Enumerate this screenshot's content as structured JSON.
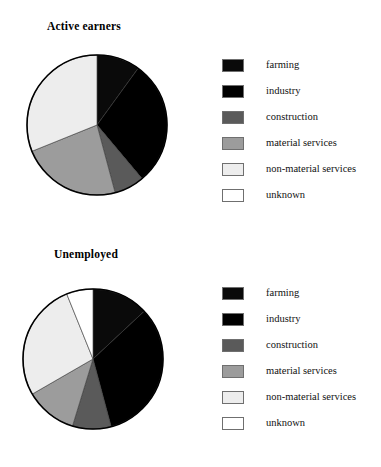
{
  "figure": {
    "background": "#ffffff",
    "palette": {
      "farming": "#0a0a0a",
      "industry": "#000000",
      "construction": "#5a5a5a",
      "material_services": "#9c9c9c",
      "non_material_services": "#ededed",
      "unknown": "#ffffff",
      "outline": "#000000",
      "swatch_border": "#6f6f6f"
    }
  },
  "charts": [
    {
      "id": "active-earners",
      "title": "Active earners",
      "geometry": {
        "cx": 96,
        "cy": 124,
        "r": 70,
        "start_angle_deg": 0
      },
      "legend": [
        {
          "key": "farming",
          "label": "farming",
          "color": "#0a0a0a"
        },
        {
          "key": "industry",
          "label": "industry",
          "color": "#000000"
        },
        {
          "key": "construction",
          "label": "construction",
          "color": "#5a5a5a"
        },
        {
          "key": "material-services",
          "label": "material services",
          "color": "#9c9c9c"
        },
        {
          "key": "non-material-services",
          "label": "non-material services",
          "color": "#ededed"
        },
        {
          "key": "unknown",
          "label": "unknown",
          "color": "#ffffff"
        }
      ]
    },
    {
      "id": "unemployed",
      "title": "Unemployed",
      "geometry": {
        "cx": 92,
        "cy": 125,
        "r": 70,
        "start_angle_deg": 0
      },
      "legend": [
        {
          "key": "farming",
          "label": "farming",
          "color": "#0a0a0a"
        },
        {
          "key": "industry",
          "label": "industry",
          "color": "#000000"
        },
        {
          "key": "construction",
          "label": "construction",
          "color": "#5a5a5a"
        },
        {
          "key": "material-services",
          "label": "material services",
          "color": "#9c9c9c"
        },
        {
          "key": "non-material-services",
          "label": "non-material services",
          "color": "#ededed"
        },
        {
          "key": "unknown",
          "label": "unknown",
          "color": "#ffffff"
        }
      ]
    }
  ],
  "chart_data": [
    {
      "type": "pie",
      "title": "Active earners",
      "xlabel": "",
      "ylabel": "",
      "legend_position": "right",
      "grid": false,
      "start_angle_deg": 0,
      "direction": "clockwise",
      "categories": [
        "farming",
        "industry",
        "construction",
        "material services",
        "non-material services",
        "unknown"
      ],
      "values": [
        10,
        29,
        7,
        23,
        31,
        0
      ],
      "units": "percent",
      "slice_angles_deg": [
        36,
        104,
        25,
        83,
        112,
        0
      ],
      "colors": [
        "#0a0a0a",
        "#000000",
        "#5a5a5a",
        "#9c9c9c",
        "#ededed",
        "#ffffff"
      ]
    },
    {
      "type": "pie",
      "title": "Unemployed",
      "xlabel": "",
      "ylabel": "",
      "legend_position": "right",
      "grid": false,
      "start_angle_deg": 0,
      "direction": "clockwise",
      "categories": [
        "farming",
        "industry",
        "construction",
        "material services",
        "non-material services",
        "unknown"
      ],
      "values": [
        13,
        33,
        9,
        12,
        27,
        6
      ],
      "units": "percent",
      "slice_angles_deg": [
        47,
        118,
        32,
        43,
        98,
        22
      ],
      "colors": [
        "#0a0a0a",
        "#000000",
        "#5a5a5a",
        "#9c9c9c",
        "#ededed",
        "#ffffff"
      ]
    }
  ]
}
